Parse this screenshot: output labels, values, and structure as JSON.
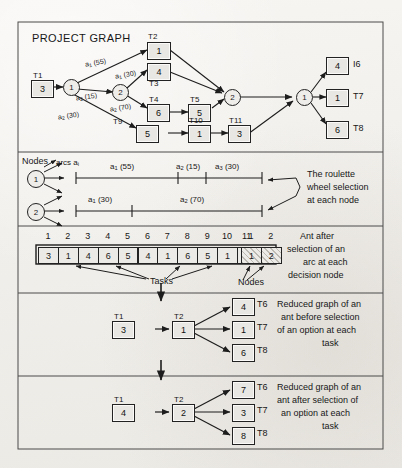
{
  "figure": {
    "title": "PROJECT GRAPH",
    "background_color": "#f2f0ec",
    "ink_color": "#1a1a1a"
  },
  "project_graph": {
    "title": "PROJECT GRAPH",
    "tasks": [
      {
        "id": "T1",
        "label": "T1",
        "value": "3"
      },
      {
        "id": "T2",
        "label": "T2",
        "value": "1"
      },
      {
        "id": "T3",
        "label": "T3",
        "value": "4"
      },
      {
        "id": "T4",
        "label": "T4",
        "value": "6"
      },
      {
        "id": "T5",
        "label": "T5",
        "value": "5"
      },
      {
        "id": "T6",
        "label": "I6",
        "value": "4"
      },
      {
        "id": "T7",
        "label": "T7",
        "value": "1"
      },
      {
        "id": "T8",
        "label": "T8",
        "value": "6"
      },
      {
        "id": "T9",
        "label": "T9",
        "value": "5"
      },
      {
        "id": "T10",
        "label": "T10",
        "value": "1"
      },
      {
        "id": "T11",
        "label": "T11",
        "value": "3"
      }
    ],
    "decision_nodes": [
      {
        "id": "n1",
        "label": "1"
      },
      {
        "id": "n2",
        "label": "2"
      },
      {
        "id": "n3",
        "label": "2"
      },
      {
        "id": "n4",
        "label": "1"
      }
    ],
    "arc_labels": [
      {
        "id": "arc-a1-55",
        "arc": "a",
        "sub": "1",
        "weight": "(55)"
      },
      {
        "id": "arc-a1-30",
        "arc": "a",
        "sub": "1",
        "weight": "(30)"
      },
      {
        "id": "arc-a2-15",
        "arc": "a",
        "sub": "2",
        "weight": "(15)"
      },
      {
        "id": "arc-a2-70",
        "arc": "a",
        "sub": "2",
        "weight": "(70)"
      },
      {
        "id": "arc-a2-30",
        "arc": "a",
        "sub": "2",
        "weight": "(30)"
      }
    ]
  },
  "roulette": {
    "nodes_label": "Nodes",
    "arcs_label": "arcs a",
    "arcs_label_sub": "i",
    "caption_lines": [
      "The roulette",
      "wheel selection",
      "at each node"
    ],
    "rows": [
      {
        "node": "1",
        "segments": [
          {
            "arc": "a",
            "sub": "1",
            "weight": "(55)",
            "span": 55
          },
          {
            "arc": "a",
            "sub": "2",
            "weight": "(15)",
            "span": 15
          },
          {
            "arc": "a",
            "sub": "3",
            "weight": "(30)",
            "span": 30
          }
        ]
      },
      {
        "node": "2",
        "segments": [
          {
            "arc": "a",
            "sub": "1",
            "weight": "(30)",
            "span": 30
          },
          {
            "arc": "a",
            "sub": "2",
            "weight": "(70)",
            "span": 70
          }
        ]
      }
    ]
  },
  "ant_array": {
    "task_headers": [
      "1",
      "2",
      "3",
      "4",
      "5",
      "6",
      "7",
      "8",
      "9",
      "10",
      "11"
    ],
    "task_values": [
      "3",
      "1",
      "4",
      "6",
      "5",
      "4",
      "1",
      "6",
      "5",
      "1",
      "3"
    ],
    "node_headers": [
      "1",
      "2"
    ],
    "node_values": [
      "1",
      "2"
    ],
    "tasks_annotation": "Tasks",
    "nodes_annotation": "Nodes",
    "caption_lines": [
      "Ant after",
      "selection of an",
      "arc at each",
      "decision node"
    ]
  },
  "reduced_before": {
    "caption_lines": [
      "Reduced graph of an",
      "ant before selection",
      "of an option at each",
      "task"
    ],
    "nodes": [
      {
        "label": "T1",
        "value": "3",
        "position": "left"
      },
      {
        "label": "T2",
        "value": "1",
        "position": "mid"
      },
      {
        "label": "T6",
        "value": "4",
        "position": "right-top"
      },
      {
        "label": "T7",
        "value": "1",
        "position": "right-mid"
      },
      {
        "label": "T8",
        "value": "6",
        "position": "right-bottom"
      }
    ]
  },
  "reduced_after": {
    "caption_lines": [
      "Reduced graph of an",
      "ant after selection of",
      "an option at each",
      "task"
    ],
    "nodes": [
      {
        "label": "T1",
        "value": "4",
        "position": "left"
      },
      {
        "label": "T2",
        "value": "2",
        "position": "mid"
      },
      {
        "label": "T6",
        "value": "7",
        "position": "right-top"
      },
      {
        "label": "T7",
        "value": "3",
        "position": "right-mid"
      },
      {
        "label": "T8",
        "value": "8",
        "position": "right-bottom"
      }
    ]
  }
}
